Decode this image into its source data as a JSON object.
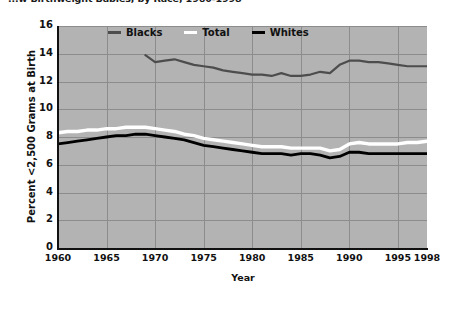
{
  "title": "...w Birthweight Babies, by Race, 1960-1998",
  "legend": {
    "position": "top-center",
    "items": [
      {
        "label": "Blacks",
        "color": "#4d4d4d",
        "icon": "line-swatch-icon"
      },
      {
        "label": "Total",
        "color": "#ffffff",
        "icon": "line-swatch-icon"
      },
      {
        "label": "Whites",
        "color": "#000000",
        "icon": "line-swatch-icon"
      }
    ]
  },
  "axes": {
    "xlabel": "Year",
    "ylabel": "Percent <2,500 Grams at Birth",
    "xticks": [
      "1960",
      "1965",
      "1970",
      "1975",
      "1980",
      "1985",
      "1990",
      "1995",
      "1998"
    ],
    "yticks": [
      "16",
      "14",
      "12",
      "10",
      "8",
      "6",
      "4",
      "2",
      "0"
    ]
  },
  "colors": {
    "plot_background": "#b3b3b3",
    "gridline": "#8c8c8c",
    "axis": "#111111",
    "page_background": "#ffffff",
    "blacks_series": "#4d4d4d",
    "total_series": "#ffffff",
    "whites_series": "#000000"
  },
  "chart_data": {
    "type": "line",
    "title": "...w Birthweight Babies, by Race, 1960-1998",
    "xlabel": "Year",
    "ylabel": "Percent <2,500 Grams at Birth",
    "xlim": [
      1960,
      1998
    ],
    "ylim": [
      0,
      16
    ],
    "xticks": [
      1960,
      1965,
      1970,
      1975,
      1980,
      1985,
      1990,
      1995,
      1998
    ],
    "yticks": [
      0,
      2,
      4,
      6,
      8,
      10,
      12,
      14,
      16
    ],
    "grid": true,
    "legend_position": "top-center",
    "series": [
      {
        "name": "Blacks",
        "color": "#4d4d4d",
        "x": [
          1969,
          1970,
          1971,
          1972,
          1973,
          1974,
          1975,
          1976,
          1977,
          1978,
          1979,
          1980,
          1981,
          1982,
          1983,
          1984,
          1985,
          1986,
          1987,
          1988,
          1989,
          1990,
          1991,
          1992,
          1993,
          1994,
          1995,
          1996,
          1997,
          1998
        ],
        "values": [
          13.9,
          13.4,
          13.5,
          13.6,
          13.4,
          13.2,
          13.1,
          13.0,
          12.8,
          12.7,
          12.6,
          12.5,
          12.5,
          12.4,
          12.6,
          12.4,
          12.4,
          12.5,
          12.7,
          12.6,
          13.2,
          13.5,
          13.5,
          13.4,
          13.4,
          13.3,
          13.2,
          13.1,
          13.1,
          13.1
        ]
      },
      {
        "name": "Total",
        "color": "#ffffff",
        "x": [
          1960,
          1961,
          1962,
          1963,
          1964,
          1965,
          1966,
          1967,
          1968,
          1969,
          1970,
          1971,
          1972,
          1973,
          1974,
          1975,
          1976,
          1977,
          1978,
          1979,
          1980,
          1981,
          1982,
          1983,
          1984,
          1985,
          1986,
          1987,
          1988,
          1989,
          1990,
          1991,
          1992,
          1993,
          1994,
          1995,
          1996,
          1997,
          1998
        ],
        "values": [
          8.3,
          8.4,
          8.4,
          8.5,
          8.5,
          8.6,
          8.6,
          8.7,
          8.7,
          8.7,
          8.6,
          8.5,
          8.4,
          8.2,
          8.1,
          7.9,
          7.8,
          7.7,
          7.6,
          7.5,
          7.4,
          7.3,
          7.3,
          7.3,
          7.2,
          7.2,
          7.2,
          7.2,
          7.0,
          7.1,
          7.5,
          7.6,
          7.5,
          7.5,
          7.5,
          7.5,
          7.6,
          7.6,
          7.7
        ]
      },
      {
        "name": "Whites",
        "color": "#000000",
        "x": [
          1960,
          1961,
          1962,
          1963,
          1964,
          1965,
          1966,
          1967,
          1968,
          1969,
          1970,
          1971,
          1972,
          1973,
          1974,
          1975,
          1976,
          1977,
          1978,
          1979,
          1980,
          1981,
          1982,
          1983,
          1984,
          1985,
          1986,
          1987,
          1988,
          1989,
          1990,
          1991,
          1992,
          1993,
          1994,
          1995,
          1996,
          1997,
          1998
        ],
        "values": [
          7.5,
          7.6,
          7.7,
          7.8,
          7.9,
          8.0,
          8.1,
          8.1,
          8.2,
          8.2,
          8.1,
          8.0,
          7.9,
          7.8,
          7.6,
          7.4,
          7.3,
          7.2,
          7.1,
          7.0,
          6.9,
          6.8,
          6.8,
          6.8,
          6.7,
          6.8,
          6.8,
          6.7,
          6.5,
          6.6,
          6.9,
          6.9,
          6.8,
          6.8,
          6.8,
          6.8,
          6.8,
          6.8,
          6.8
        ]
      }
    ]
  }
}
